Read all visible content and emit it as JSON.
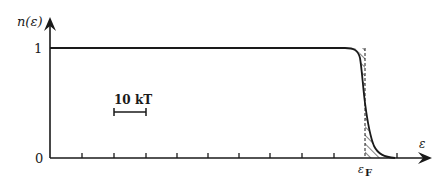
{
  "diagram": {
    "y_axis_label": "n(ε)",
    "x_axis_label": "ε",
    "y_tick_labels": {
      "one": "1",
      "zero": "0"
    },
    "fermi_label_main": "ε",
    "fermi_label_sub": "F",
    "scale_bar_label": "10 kT",
    "n_ticks": 11,
    "colors": {
      "ink": "#1a1a1a",
      "background": "#ffffff"
    }
  }
}
